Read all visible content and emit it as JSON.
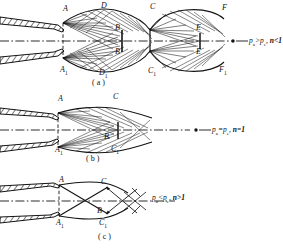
{
  "figure": {
    "ink_color": "#141414",
    "paper_color": "#ffffff"
  },
  "panels": [
    {
      "id": "a",
      "caption": "( a )",
      "condition": {
        "pressure": "p",
        "pressure_sub_1": "a",
        "relation": ">",
        "pressure2_sub": "e",
        "text": "p",
        "full": "pa > pe,  n<1",
        "n_text": "n<1"
      },
      "points": [
        {
          "label": "A",
          "sub": "",
          "x": 63,
          "y": 11
        },
        {
          "label": "D",
          "sub": "",
          "x": 101,
          "y": 8
        },
        {
          "label": "C",
          "sub": "",
          "x": 150,
          "y": 9
        },
        {
          "label": "F",
          "sub": "",
          "x": 222,
          "y": 10
        },
        {
          "label": "B",
          "sub": "",
          "x": 115,
          "y": 29
        },
        {
          "label": "B",
          "sub": "",
          "x": 115,
          "y": 52
        },
        {
          "label": "E",
          "sub": "",
          "x": 196,
          "y": 29
        },
        {
          "label": "E",
          "sub": "",
          "x": 196,
          "y": 52
        },
        {
          "label": "A",
          "sub": "1",
          "x": 62,
          "y": 70
        },
        {
          "label": "D",
          "sub": "1",
          "x": 101,
          "y": 73
        },
        {
          "label": "C",
          "sub": "1",
          "x": 150,
          "y": 71
        },
        {
          "label": "F",
          "sub": "1",
          "x": 221,
          "y": 70
        }
      ]
    },
    {
      "id": "b",
      "caption": "( b )",
      "condition": {
        "full": "pa = pe,  n=1",
        "n_text": "n=1"
      },
      "points": [
        {
          "label": "A",
          "sub": "",
          "x": 58,
          "y": 101
        },
        {
          "label": "C",
          "sub": "",
          "x": 113,
          "y": 99
        },
        {
          "label": "B",
          "sub": "",
          "x": 104,
          "y": 129
        },
        {
          "label": "A",
          "sub": "1",
          "x": 57,
          "y": 145
        },
        {
          "label": "C",
          "sub": "1",
          "x": 113,
          "y": 144
        }
      ]
    },
    {
      "id": "c",
      "caption": "( c )",
      "condition": {
        "full": "pa < pe,  n>1",
        "n_text": "n>1"
      },
      "points": [
        {
          "label": "A",
          "sub": "",
          "x": 59,
          "y": 174
        },
        {
          "label": "C",
          "sub": "",
          "x": 100,
          "y": 176
        },
        {
          "label": "B",
          "sub": "",
          "x": 97,
          "y": 211
        },
        {
          "label": "A",
          "sub": "1",
          "x": 58,
          "y": 222
        },
        {
          "label": "C",
          "sub": "1",
          "x": 100,
          "y": 224
        }
      ]
    }
  ],
  "symbols": {
    "pressure_ambient": "p",
    "sub_a": "a",
    "pressure_exit": "p",
    "sub_e": "e",
    "expansion_ratio": "n"
  }
}
